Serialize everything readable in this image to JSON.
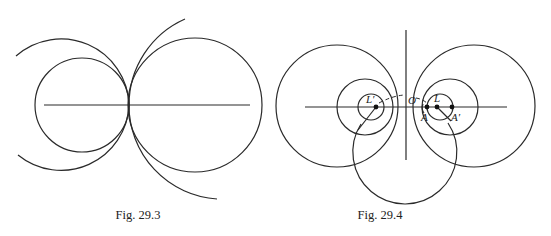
{
  "figures": [
    {
      "id": "fig-29-3",
      "caption": "Fig. 29.3"
    },
    {
      "id": "fig-29-4",
      "caption": "Fig. 29.4",
      "labels": {
        "L_prime": "L′",
        "O": "O",
        "L": "L",
        "A": "A",
        "A_prime": "A′"
      }
    }
  ],
  "colors": {
    "line": "#2a2a2a",
    "background": "#ffffff"
  }
}
